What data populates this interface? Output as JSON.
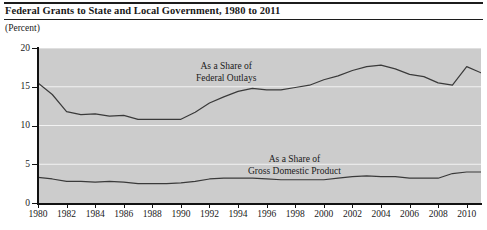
{
  "header": {
    "title": "Federal Grants to State and Local Government, 1980 to 2011",
    "unit_label": "(Percent)"
  },
  "annotations": {
    "outlays_line1": "As a Share of",
    "outlays_line2": "Federal Outlays",
    "gdp_line1": "As a Share of",
    "gdp_line2": "Gross Domestic Product"
  },
  "colors": {
    "plot_background": "#cccccc",
    "gridline": "#f2f2f2",
    "axis": "#111111",
    "series_line": "#3a3a3a",
    "text": "#1a1a1a"
  },
  "chart_data": {
    "type": "line",
    "title": "Federal Grants to State and Local Government, 1980 to 2011",
    "xlabel": "",
    "ylabel": "(Percent)",
    "xlim": [
      1980,
      2011
    ],
    "ylim": [
      0,
      20
    ],
    "yticks": [
      0,
      5,
      10,
      15,
      20
    ],
    "xticks": [
      1980,
      1982,
      1984,
      1986,
      1988,
      1990,
      1992,
      1994,
      1996,
      1998,
      2000,
      2002,
      2004,
      2006,
      2008,
      2010
    ],
    "grid": true,
    "legend": "annotated-inline",
    "x": [
      1980,
      1981,
      1982,
      1983,
      1984,
      1985,
      1986,
      1987,
      1988,
      1989,
      1990,
      1991,
      1992,
      1993,
      1994,
      1995,
      1996,
      1997,
      1998,
      1999,
      2000,
      2001,
      2002,
      2003,
      2004,
      2005,
      2006,
      2007,
      2008,
      2009,
      2010,
      2011
    ],
    "series": [
      {
        "name": "As a Share of Federal Outlays",
        "values": [
          15.5,
          14.0,
          11.8,
          11.4,
          11.5,
          11.2,
          11.3,
          10.8,
          10.8,
          10.8,
          10.8,
          11.7,
          12.9,
          13.7,
          14.4,
          14.8,
          14.6,
          14.6,
          14.9,
          15.2,
          15.9,
          16.4,
          17.1,
          17.6,
          17.8,
          17.3,
          16.6,
          16.3,
          15.5,
          15.2,
          17.6,
          16.8
        ]
      },
      {
        "name": "As a Share of Gross Domestic Product",
        "values": [
          3.3,
          3.1,
          2.8,
          2.8,
          2.7,
          2.8,
          2.7,
          2.5,
          2.5,
          2.5,
          2.6,
          2.8,
          3.1,
          3.2,
          3.2,
          3.2,
          3.1,
          3.0,
          3.0,
          3.0,
          3.0,
          3.2,
          3.4,
          3.5,
          3.4,
          3.4,
          3.2,
          3.2,
          3.2,
          3.8,
          4.0,
          4.0
        ]
      }
    ]
  }
}
